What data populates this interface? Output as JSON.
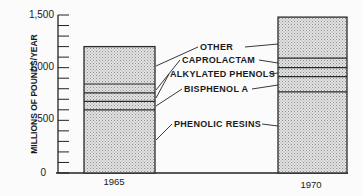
{
  "chart_data": {
    "type": "bar",
    "stacked": true,
    "title": "",
    "xlabel": "",
    "ylabel": "MILLIONS OF POUNDS/YEAR",
    "ylim": [
      0,
      1500
    ],
    "yticks": [
      0,
      500,
      1000,
      1500
    ],
    "ytick_labels": [
      "0",
      "500",
      "1,000",
      "1,500"
    ],
    "minor_tick_step": 100,
    "grid": false,
    "categories": [
      "1965",
      "1970"
    ],
    "series": [
      {
        "name": "PHENOLIC RESINS",
        "values": [
          600,
          770
        ]
      },
      {
        "name": "BISPHENOL A",
        "values": [
          80,
          145
        ]
      },
      {
        "name": "ALKYLATED PHENOLS",
        "values": [
          80,
          85
        ]
      },
      {
        "name": "CAPROLACTAM",
        "values": [
          85,
          90
        ]
      },
      {
        "name": "OTHER",
        "values": [
          355,
          390
        ]
      }
    ],
    "totals": [
      1200,
      1480
    ],
    "legend_position": "between bars, leader lines to segments",
    "colors": {
      "bar_fill": "#cfcfcf",
      "outline": "#2a2a2a",
      "background": "#fbfbfb"
    }
  }
}
